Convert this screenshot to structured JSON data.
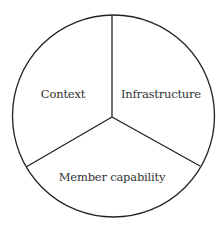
{
  "diagram": {
    "type": "pie-divided-circle",
    "stroke_color": "#222222",
    "text_color": "#333333",
    "background": "#ffffff",
    "circle": {
      "cx": 113.5,
      "cy": 116,
      "r": 101
    },
    "center": {
      "x": 112,
      "y": 117
    },
    "segments": [
      {
        "id": "context",
        "label": "Context",
        "label_pos": {
          "x": 63,
          "y": 95
        }
      },
      {
        "id": "infrastructure",
        "label": "Infrastructure",
        "label_pos": {
          "x": 161,
          "y": 95
        }
      },
      {
        "id": "member-capability",
        "label": "Member capability",
        "label_pos": {
          "x": 112,
          "y": 178
        }
      }
    ],
    "dividers": [
      {
        "x2": 112,
        "y2": 15
      },
      {
        "x2": 26,
        "y2": 167
      },
      {
        "x2": 200,
        "y2": 166
      }
    ]
  }
}
